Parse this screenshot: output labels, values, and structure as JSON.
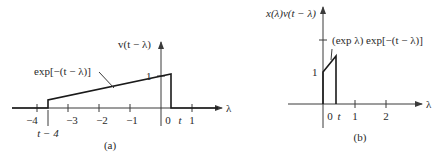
{
  "panel_a": {
    "caption": "(a)",
    "y_axis_label": "v(t − λ)",
    "x_axis_label": "λ",
    "curve_label": "exp[−(t − λ)]",
    "level_label": "1",
    "tick_labels": [
      "−4",
      "−3",
      "−2",
      "−1",
      "0",
      "t",
      "1"
    ],
    "shift_label": "t − 4"
  },
  "panel_b": {
    "caption": "(b)",
    "y_axis_label": "x(λ)v(t − λ)",
    "x_axis_label": "λ",
    "curve_label": "(exp λ) exp[−(t − λ)]",
    "level_label": "1",
    "tick_labels": [
      "0",
      "t",
      "1",
      "2"
    ]
  },
  "colors": {
    "line": "#1a1a1a",
    "axis": "#3a3a3a",
    "text": "#2a2a2a",
    "background": "#ffffff"
  }
}
